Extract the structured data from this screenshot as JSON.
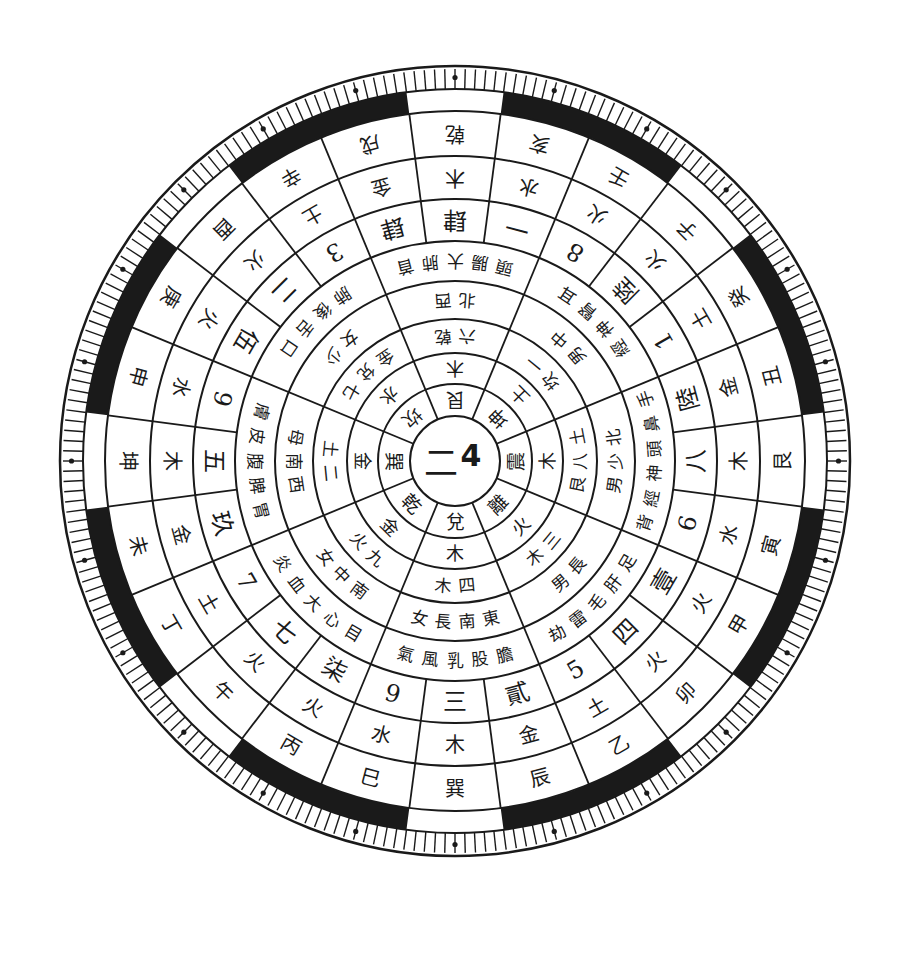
{
  "diagram": {
    "title": "",
    "center": {
      "x": 455,
      "y": 461
    },
    "colors": {
      "ink": "#1a1a1a",
      "paper": "#ffffff"
    },
    "hub": {
      "chars": [
        "二",
        "4"
      ]
    },
    "rings": {
      "trigrams": {
        "comment": "ring 1, 8 sectors, starting at top going clockwise",
        "labels": [
          "艮",
          "坤",
          "震",
          "離",
          "兌",
          "乾",
          "巽",
          "坎"
        ]
      },
      "ring2": {
        "labels": [
          "山",
          "地",
          "雷",
          "火",
          "澤",
          "天",
          "風",
          "水"
        ]
      },
      "ring3": {
        "labels": [
          "木",
          "土",
          "木",
          "火",
          "木",
          "金",
          "金",
          "水"
        ]
      },
      "ring4": {
        "labels": [
          "乾六",
          "一坎",
          "土八艮",
          "三木",
          "四木",
          "九火",
          "二土",
          "七兌金"
        ]
      },
      "ring5": {
        "labels": [
          "西北",
          "中男",
          "北少男",
          "長男",
          "東南長女",
          "南中女",
          "西南母",
          "少女"
        ]
      },
      "ring6": {
        "labels": [
          "首肺大腸頭",
          "耳腎神經",
          "手鼻頭神經背",
          "足肝毛雷劫",
          "膽股乳風氣",
          "目心大血炎",
          "胃脾腹皮膚",
          "口舌後肺"
        ]
      },
      "numbers": {
        "comment": "24-sector ring of numerals",
        "labels": [
          "肆",
          "一",
          "8",
          "陸",
          "1",
          "陸",
          "八",
          "6",
          "壹",
          "四",
          "5",
          "貳",
          "三",
          "9",
          "柒",
          "七",
          "7",
          "玖",
          "五",
          "9",
          "伍",
          "二",
          "3",
          "肆"
        ]
      },
      "elements": {
        "labels": [
          "木",
          "水",
          "火",
          "火",
          "土",
          "金",
          "木",
          "水",
          "火",
          "火",
          "土",
          "金",
          "木",
          "水",
          "火",
          "火",
          "土",
          "金",
          "木",
          "水",
          "火",
          "火",
          "土",
          "金"
        ]
      },
      "mountains": {
        "labels": [
          "乾",
          "亥",
          "壬",
          "子",
          "癸",
          "丑",
          "艮",
          "寅",
          "甲",
          "卯",
          "乙",
          "辰",
          "巽",
          "巳",
          "丙",
          "午",
          "丁",
          "未",
          "坤",
          "申",
          "庚",
          "酉",
          "辛",
          "戌"
        ]
      }
    }
  }
}
